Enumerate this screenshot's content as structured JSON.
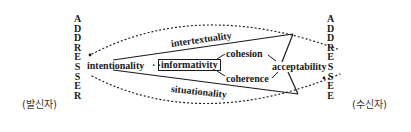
{
  "diagram": {
    "addresser": {
      "letters": [
        "A",
        "D",
        "D",
        "R",
        "E",
        "S",
        "S",
        "E",
        "R"
      ],
      "korean": "(발신자)"
    },
    "addressee": {
      "letters": [
        "A",
        "D",
        "D",
        "R",
        "E",
        "S",
        "S",
        "E",
        "E"
      ],
      "korean": "(수신자)"
    },
    "labels": {
      "intertextuality": "intertextuality",
      "intentionality": "intentionality",
      "dots": "· · ·",
      "informativity": "informativity",
      "cohesion": "cohesion",
      "coherence": "coherence",
      "acceptability": "acceptability",
      "situationality": "situationality"
    },
    "colors": {
      "ink": "#1a1a1a",
      "background": "#ffffff"
    }
  }
}
